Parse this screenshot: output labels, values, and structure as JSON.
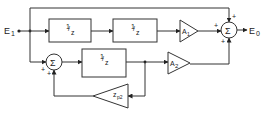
{
  "diagram": {
    "type": "block-diagram",
    "input": {
      "label": "E",
      "sub": "1"
    },
    "output": {
      "label": "E",
      "sub": "0"
    },
    "blocks": [
      {
        "id": "delay1",
        "label": "1/z",
        "num": "1",
        "den": "z"
      },
      {
        "id": "delay2",
        "label": "1/z",
        "num": "1",
        "den": "z"
      },
      {
        "id": "delay3",
        "label": "1/z",
        "num": "1",
        "den": "z"
      }
    ],
    "gains": [
      {
        "id": "A1",
        "label": "A",
        "sub": "1"
      },
      {
        "id": "A2",
        "label": "A",
        "sub": "2"
      },
      {
        "id": "feedback",
        "label": "z",
        "sub": "p2"
      }
    ],
    "summers": [
      {
        "id": "output_sum",
        "symbol": "Σ",
        "signs": [
          "+",
          "+",
          "+"
        ]
      },
      {
        "id": "loop_sum",
        "symbol": "Σ",
        "signs": [
          "+",
          "+"
        ]
      }
    ],
    "connections": [
      "E1 -> delay1 -> delay2 -> A1 -> output_sum(+)",
      "E1 -> output_sum(+) (direct feedforward, top)",
      "E1 -> loop_sum(+) -> delay3 -> A2 -> output_sum(+)",
      "delay3 output -> feedback(zp2) -> loop_sum(+)",
      "output_sum -> E0"
    ],
    "colors": {
      "line": "#333333",
      "background": "#ffffff"
    }
  }
}
